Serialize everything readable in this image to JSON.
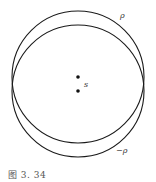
{
  "figure": {
    "caption": "图 3. 34",
    "circles": [
      {
        "name": "upper-circle",
        "cx": 78,
        "cy": 77,
        "r": 66,
        "label": "ρ"
      },
      {
        "name": "lower-circle",
        "cx": 78,
        "cy": 91,
        "r": 66,
        "label": "−ρ"
      }
    ],
    "points": [
      {
        "name": "upper-point",
        "x": 78,
        "y": 77
      },
      {
        "name": "lower-point",
        "x": 78,
        "y": 91
      }
    ],
    "labels": {
      "rho": "ρ",
      "neg_rho": "−ρ",
      "s": "s"
    },
    "colors": {
      "stroke": "#1a1a1a",
      "text": "#333333",
      "background": "#ffffff"
    }
  }
}
